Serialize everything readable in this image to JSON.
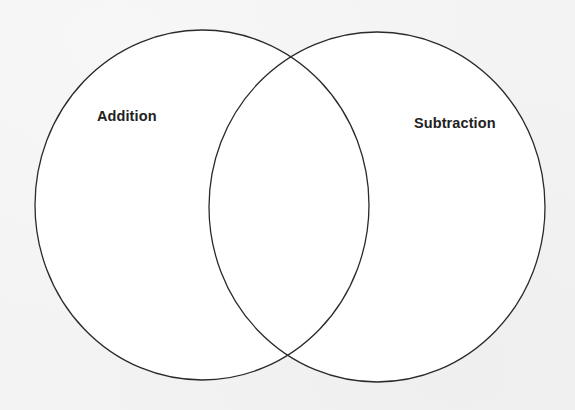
{
  "diagram": {
    "type": "venn",
    "sets": [
      {
        "id": "left",
        "label": "Addition",
        "shape": {
          "cx": 202,
          "cy": 205,
          "rx": 167,
          "ry": 175
        }
      },
      {
        "id": "right",
        "label": "Subtraction",
        "shape": {
          "cx": 377,
          "cy": 207,
          "rx": 168,
          "ry": 175
        }
      }
    ],
    "intersection_label": "",
    "colors": {
      "background": "#f3f3f3",
      "circle_fill": "#ffffff",
      "stroke": "#2a2a2a",
      "text": "#222222"
    }
  }
}
